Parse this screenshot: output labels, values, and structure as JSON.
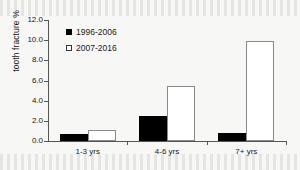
{
  "chart_data": {
    "type": "bar",
    "title": "",
    "xlabel": "",
    "ylabel": "tooth fracture %",
    "categories": [
      "1-3 yrs",
      "4-6 yrs",
      "7+ yrs"
    ],
    "series": [
      {
        "name": "1996-2006",
        "marker": "filled-square",
        "color": "#000000",
        "values": [
          0.7,
          2.5,
          0.8
        ]
      },
      {
        "name": "2007-2016",
        "marker": "open-square",
        "color": "#ffffff",
        "values": [
          1.1,
          5.5,
          9.9
        ]
      }
    ],
    "ylim": [
      0.0,
      12.0
    ],
    "ytick_step": 2.0,
    "yticks": [
      "0.0",
      "2.0",
      "4.0",
      "6.0",
      "8.0",
      "10.0",
      "12.0"
    ],
    "ytick_values": [
      0.0,
      2.0,
      4.0,
      6.0,
      8.0,
      10.0,
      12.0
    ],
    "grid": false,
    "legend_position": "top-left",
    "axis_color": "#555555",
    "background_color": "#f7f7f5"
  }
}
